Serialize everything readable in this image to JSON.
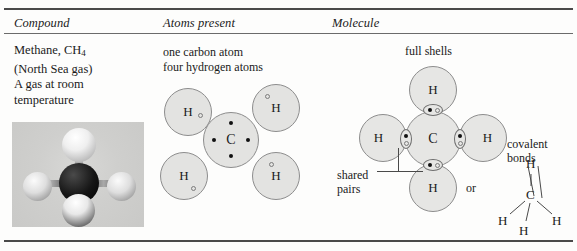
{
  "figure": {
    "columns": [
      {
        "id": "compound",
        "header": "Compound"
      },
      {
        "id": "atoms",
        "header": "Atoms present"
      },
      {
        "id": "molecule",
        "header": "Molecule"
      }
    ]
  },
  "compound": {
    "lines": [
      "Methane, CH",
      "(North Sea gas)",
      "A gas at room",
      "temperature"
    ],
    "formula_subscript": "4",
    "photo_alt": "methane-ball-and-stick-model"
  },
  "atoms_present": {
    "caption_lines": [
      "one carbon atom",
      "four hydrogen atoms"
    ],
    "carbon": {
      "symbol": "C",
      "electrons": 4
    },
    "hydrogens": [
      {
        "symbol": "H",
        "electrons": 1
      },
      {
        "symbol": "H",
        "electrons": 1
      },
      {
        "symbol": "H",
        "electrons": 1
      },
      {
        "symbol": "H",
        "electrons": 1
      }
    ]
  },
  "molecule": {
    "carbon": {
      "symbol": "C"
    },
    "hydrogens": [
      {
        "symbol": "H",
        "position": "top"
      },
      {
        "symbol": "H",
        "position": "left"
      },
      {
        "symbol": "H",
        "position": "right"
      },
      {
        "symbol": "H",
        "position": "bottom"
      }
    ],
    "labels": {
      "full_shells": "full shells",
      "shared_pairs_line1": "shared",
      "shared_pairs_line2": "pairs",
      "or": "or",
      "covalent_line1": "covalent",
      "covalent_line2": "bonds"
    },
    "shared_pairs": 4
  },
  "structural_formula": {
    "center": "C",
    "top": "H",
    "left": "H",
    "middle": "H",
    "right": "H"
  },
  "colors": {
    "rule": "#4a4a4a",
    "atom_fill": "#e3e3e1",
    "atom_stroke": "#8d8d8d",
    "electron_dot": "#111111",
    "text": "#1a1a1a"
  }
}
